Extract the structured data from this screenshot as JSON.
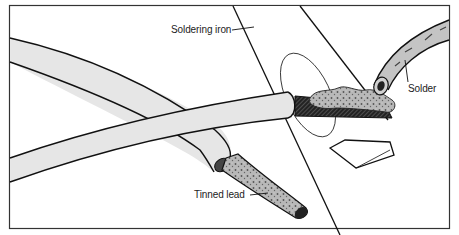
{
  "figure": {
    "type": "technical-illustration",
    "labels": {
      "soldering_iron": "Soldering iron",
      "solder": "Solder",
      "tinned_lead": "Tinned lead"
    },
    "colors": {
      "insulation_fill": "#e6e6e6",
      "outline": "#111111",
      "solder_fill": "#bdbdbd",
      "frame": "#333333",
      "background": "#ffffff"
    }
  }
}
